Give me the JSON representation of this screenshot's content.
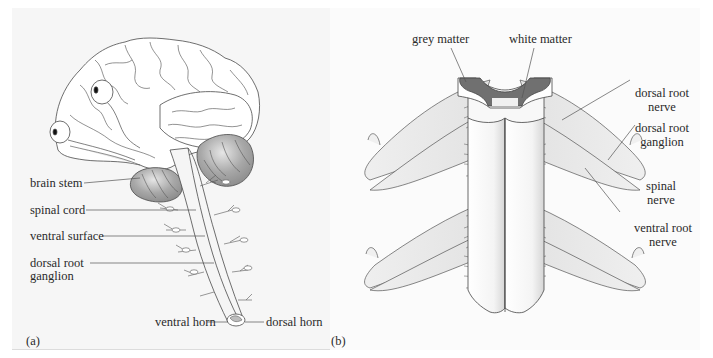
{
  "figure": {
    "panel_a": {
      "id_label": "(a)",
      "labels": {
        "brain_stem": "brain stem",
        "spinal_cord": "spinal cord",
        "ventral_surface": "ventral surface",
        "dorsal_root_ganglion_1": "dorsal root",
        "dorsal_root_ganglion_2": "ganglion",
        "ventral_horn": "ventral horn",
        "dorsal_horn": "dorsal horn"
      }
    },
    "panel_b": {
      "id_label": "(b)",
      "labels": {
        "grey_matter": "grey matter",
        "white_matter": "white matter",
        "dorsal_root_nerve_1": "dorsal root",
        "dorsal_root_nerve_2": "nerve",
        "dorsal_root_ganglion_1": "dorsal root",
        "dorsal_root_ganglion_2": "ganglion",
        "spinal_nerve_1": "spinal",
        "spinal_nerve_2": "nerve",
        "ventral_root_nerve_1": "ventral root",
        "ventral_root_nerve_2": "nerve"
      }
    },
    "colors": {
      "background": "#f6f6f6",
      "line": "#555555",
      "grey_matter": "#6e6e6e",
      "cerebellum": "#9a9a9a",
      "nerve_fill": "#e4e4e4"
    }
  }
}
